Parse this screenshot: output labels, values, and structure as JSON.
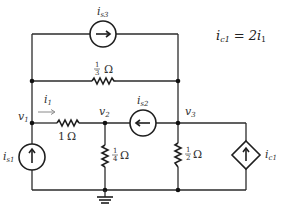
{
  "diagram": {
    "type": "circuit-schematic",
    "equation": {
      "lhs": "i",
      "lhs_sub": "c1",
      "eq": "=",
      "rhs": "2i",
      "rhs_sub": "1"
    },
    "nodes": [
      {
        "id": "v1",
        "label": "v",
        "sub": "1"
      },
      {
        "id": "v2",
        "label": "v",
        "sub": "2"
      },
      {
        "id": "v3",
        "label": "v",
        "sub": "3"
      }
    ],
    "sources": [
      {
        "id": "is1",
        "label": "i",
        "sub": "s1",
        "type": "independent-current",
        "direction": "up"
      },
      {
        "id": "is2",
        "label": "i",
        "sub": "s2",
        "type": "independent-current",
        "direction": "left"
      },
      {
        "id": "is3",
        "label": "i",
        "sub": "s3",
        "type": "independent-current",
        "direction": "right"
      },
      {
        "id": "ic1",
        "label": "i",
        "sub": "c1",
        "type": "dependent-current",
        "direction": "up"
      }
    ],
    "resistors": [
      {
        "id": "r13",
        "num": "1",
        "den": "3",
        "unit": "Ω",
        "between": "v1-v3 (upper branch)"
      },
      {
        "id": "r1",
        "value": "1",
        "unit": "Ω",
        "between": "v1-v2"
      },
      {
        "id": "r14",
        "num": "1",
        "den": "4",
        "unit": "Ω",
        "between": "v2-ground"
      },
      {
        "id": "r12",
        "num": "1",
        "den": "2",
        "unit": "Ω",
        "between": "v3-ground"
      }
    ],
    "current_label": {
      "label": "i",
      "sub": "1"
    },
    "arrows": {
      "right": "→",
      "left": "←",
      "up": "↑"
    }
  }
}
